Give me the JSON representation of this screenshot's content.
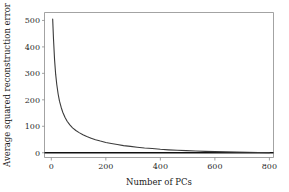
{
  "chart_data": {
    "type": "line",
    "title": "",
    "xlabel": "Number of PCs",
    "ylabel": "Average squared reconstruction error",
    "xlim": [
      -25,
      815
    ],
    "ylim": [
      -18,
      530
    ],
    "xticks": [
      0,
      200,
      400,
      600,
      800
    ],
    "xtick_labels": [
      "0",
      "200",
      "400",
      "600",
      "800"
    ],
    "yticks": [
      0,
      100,
      200,
      300,
      400,
      500
    ],
    "ytick_labels": [
      "0",
      "100",
      "200",
      "300",
      "400",
      "500"
    ],
    "grid": false,
    "legend": null,
    "series": [
      {
        "name": "Average squared reconstruction error",
        "color": "#3b3b3b",
        "x": [
          5,
          8,
          12,
          16,
          20,
          25,
          30,
          36,
          42,
          50,
          58,
          68,
          78,
          90,
          102,
          116,
          130,
          146,
          162,
          180,
          200,
          220,
          242,
          265,
          290,
          315,
          342,
          370,
          400,
          430,
          462,
          495,
          530,
          565,
          600,
          640,
          680,
          720,
          760,
          800
        ],
        "y": [
          505,
          430,
          350,
          296,
          258,
          222,
          195,
          172,
          153,
          134,
          119,
          105,
          94,
          84,
          76,
          68,
          61,
          55,
          49,
          44,
          39,
          35,
          31,
          27,
          24,
          21,
          18,
          16,
          13,
          11,
          9.5,
          8,
          6.5,
          5.2,
          4.2,
          3.2,
          2.4,
          1.7,
          1.1,
          0.5
        ]
      }
    ],
    "baseline": {
      "name": "zero-axis-line",
      "y": 0,
      "x_start": -25,
      "x_end": 815,
      "color": "#111111"
    }
  }
}
